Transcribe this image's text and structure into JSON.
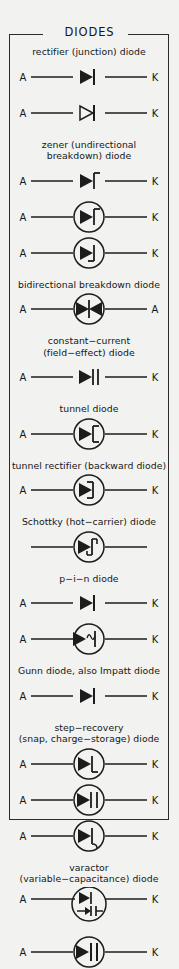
{
  "sheet": {
    "title": "DIODES",
    "terminal_a": "A",
    "terminal_k": "K",
    "line_color": "#1c1c1c",
    "background_color": "#f2f2f0",
    "text_color": "#161616"
  },
  "entries": [
    {
      "id": "rectifier",
      "caption": "rectifier (junction) diode",
      "symbols": [
        {
          "name": "rectifier-filled",
          "left": "A",
          "right": "K",
          "glyph": "filled-triangle-bar",
          "circled": false
        },
        {
          "name": "rectifier-open",
          "left": "A",
          "right": "K",
          "glyph": "open-triangle-bar",
          "circled": false
        }
      ]
    },
    {
      "id": "zener",
      "caption": "zener (undirectional\nbreakdown) diode",
      "symbols": [
        {
          "name": "zener-plain",
          "left": "A",
          "right": "K",
          "glyph": "zener-bar-hook-top-right",
          "circled": false
        },
        {
          "name": "zener-circled",
          "left": "A",
          "right": "K",
          "glyph": "zener-bar-hook-top-right",
          "circled": true
        },
        {
          "name": "zener-circled-alt",
          "left": "A",
          "right": "K",
          "glyph": "zener-bar-hook-bottom-left",
          "circled": true
        }
      ]
    },
    {
      "id": "bidirectional",
      "caption": "bidirectional breakdown diode",
      "symbols": [
        {
          "name": "bidirectional-breakdown",
          "left": "A",
          "right": "A",
          "glyph": "double-triangle-bar",
          "circled": true
        }
      ]
    },
    {
      "id": "constant-current",
      "caption": "constant−current\n(field−effect) diode",
      "symbols": [
        {
          "name": "constant-current",
          "left": "A",
          "right": "K",
          "glyph": "triangle-double-bar",
          "circled": false
        }
      ]
    },
    {
      "id": "tunnel",
      "caption": "tunnel diode",
      "symbols": [
        {
          "name": "tunnel-diode",
          "left": "A",
          "right": "K",
          "glyph": "bar-bracket-right",
          "circled": true
        }
      ]
    },
    {
      "id": "tunnel-rectifier",
      "caption": "tunnel rectifier (backward diode)",
      "symbols": [
        {
          "name": "tunnel-rectifier",
          "left": "A",
          "right": "K",
          "glyph": "bar-bracket-left",
          "circled": true
        }
      ]
    },
    {
      "id": "schottky",
      "caption": "Schottky (hot−carrier) diode",
      "symbols": [
        {
          "name": "schottky-diode",
          "left": "",
          "right": "",
          "glyph": "schottky-s-bar",
          "circled": true
        }
      ]
    },
    {
      "id": "pin",
      "caption": "p−i−n diode",
      "symbols": [
        {
          "name": "pin-plain",
          "left": "A",
          "right": "K",
          "glyph": "filled-triangle-bar",
          "circled": false
        },
        {
          "name": "pin-circled",
          "left": "A",
          "right": "K",
          "glyph": "triangle-squiggle-bar",
          "circled": true
        }
      ]
    },
    {
      "id": "gunn",
      "caption": "Gunn diode, also Impatt diode",
      "symbols": [
        {
          "name": "gunn-diode",
          "left": "A",
          "right": "K",
          "glyph": "filled-triangle-bar",
          "circled": false
        }
      ]
    },
    {
      "id": "step-recovery",
      "caption": "step−recovery\n(snap, charge−storage) diode",
      "symbols": [
        {
          "name": "step-recovery-a",
          "left": "A",
          "right": "K",
          "glyph": "bar-hook-bottom-right",
          "circled": true
        },
        {
          "name": "step-recovery-b",
          "left": "A",
          "right": "K",
          "glyph": "double-bar",
          "circled": true
        },
        {
          "name": "step-recovery-c",
          "left": "A",
          "right": "K",
          "glyph": "bar-curl-bottom",
          "circled": true
        }
      ]
    },
    {
      "id": "varactor",
      "caption": "varactor\n(variable−capacitance) diode",
      "symbols": [
        {
          "name": "varactor-a",
          "left": "A",
          "right": "K",
          "glyph": "varactor-stacked",
          "circled": true
        },
        {
          "name": "varactor-b",
          "left": "A",
          "right": "K",
          "glyph": "triangle-cap-bars",
          "circled": true
        }
      ]
    }
  ]
}
